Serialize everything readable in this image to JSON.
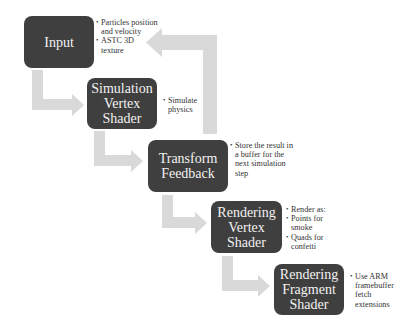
{
  "diagram": {
    "colors": {
      "box_fill": "#3f3f3f",
      "box_text": "#f2f2f2",
      "arrow_fill": "#d9d9d9",
      "note_text": "#333333",
      "background": "#ffffff"
    },
    "stages": [
      {
        "id": "input",
        "label": "Input",
        "notes": [
          "Particles position and velocity",
          "ASTC 3D texture"
        ]
      },
      {
        "id": "simulation-vertex-shader",
        "label": "Simulation\nVertex\nShader",
        "notes": [
          "Simulate physics"
        ]
      },
      {
        "id": "transform-feedback",
        "label": "Transform\nFeedback",
        "notes": [
          "Store the result in a buffer for the next simulation step"
        ]
      },
      {
        "id": "rendering-vertex-shader",
        "label": "Rendering\nVertex\nShader",
        "notes": [
          "Render as:",
          "Points for smoke",
          "Quads for confetti"
        ]
      },
      {
        "id": "rendering-fragment-shader",
        "label": "Rendering\nFragment\nShader",
        "notes": [
          "Use ARM framebuffer fetch extensions"
        ]
      }
    ],
    "connections": [
      {
        "from": "input",
        "to": "simulation-vertex-shader"
      },
      {
        "from": "simulation-vertex-shader",
        "to": "transform-feedback"
      },
      {
        "from": "transform-feedback",
        "to": "input",
        "type": "loop-back"
      },
      {
        "from": "transform-feedback",
        "to": "rendering-vertex-shader"
      },
      {
        "from": "rendering-vertex-shader",
        "to": "rendering-fragment-shader"
      }
    ]
  }
}
